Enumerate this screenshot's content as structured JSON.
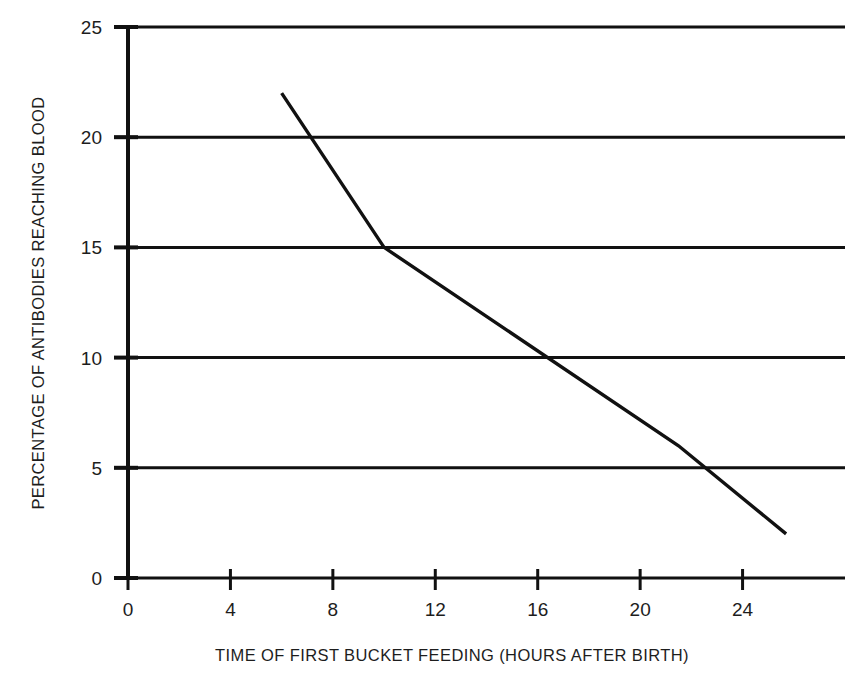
{
  "chart_data": {
    "type": "line",
    "title": "",
    "xlabel": "TIME OF FIRST BUCKET FEEDING (HOURS AFTER BIRTH)",
    "ylabel": "PERCENTAGE OF ANTIBODIES REACHING BLOOD",
    "xlim": [
      0,
      28
    ],
    "ylim": [
      0,
      25
    ],
    "xticks": [
      0,
      4,
      8,
      12,
      16,
      20,
      24
    ],
    "xtick_labels": [
      "0",
      "4",
      "8",
      "12",
      "16",
      "20",
      "24"
    ],
    "yticks": [
      0,
      5,
      10,
      15,
      20,
      25
    ],
    "ytick_labels": [
      "0",
      "5",
      "10",
      "15",
      "20",
      "25"
    ],
    "grid": "horizontal",
    "legend": "none",
    "line_color": "#111111",
    "grid_color": "#111111",
    "axis_color": "#111111",
    "background_color": "#ffffff",
    "series": [
      {
        "name": "Antibodies reaching blood",
        "x": [
          6,
          10,
          21.5,
          25.7
        ],
        "values": [
          22,
          15,
          6,
          2
        ]
      }
    ]
  },
  "axes": {
    "x_title": "TIME OF FIRST BUCKET FEEDING (HOURS AFTER BIRTH)",
    "y_title": "PERCENTAGE OF ANTIBODIES REACHING BLOOD"
  }
}
